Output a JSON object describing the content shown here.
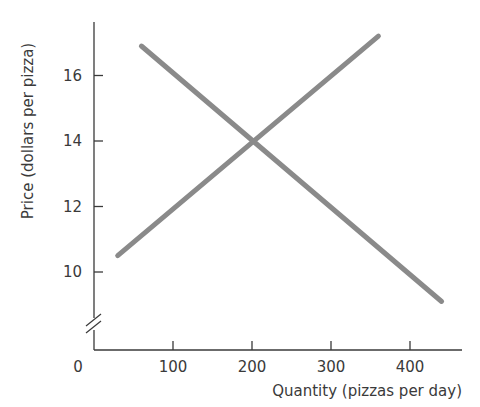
{
  "chart_data": {
    "type": "line",
    "title": "",
    "xlabel": "Quantity (pizzas per day)",
    "ylabel": "Price (dollars per pizza)",
    "xlim": [
      0,
      460
    ],
    "ylim": [
      8,
      17.5
    ],
    "y_axis_break": true,
    "grid": false,
    "legend": "none",
    "x_ticks": [
      0,
      100,
      200,
      300,
      400
    ],
    "x_tick_labels": [
      "0",
      "100",
      "200",
      "300",
      "400"
    ],
    "y_ticks": [
      10,
      12,
      14,
      16
    ],
    "y_tick_labels": [
      "10",
      "12",
      "14",
      "16"
    ],
    "series": [
      {
        "name": "Supply",
        "color": "#8a8a8a",
        "x": [
          30,
          360
        ],
        "y": [
          10.5,
          17.2
        ]
      },
      {
        "name": "Demand",
        "color": "#8a8a8a",
        "x": [
          60,
          440
        ],
        "y": [
          16.9,
          9.1
        ]
      }
    ],
    "annotations": [
      {
        "type": "intersection",
        "x": 200,
        "y": 14
      }
    ]
  },
  "colors": {
    "axis": "#3a3a3a",
    "line": "#8a8a8a",
    "text": "#3a3a3a"
  }
}
